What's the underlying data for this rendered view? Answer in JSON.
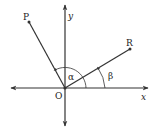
{
  "diagram": {
    "type": "coordinate-angles",
    "labels": {
      "x_axis": "x",
      "y_axis": "y",
      "origin": "O",
      "point_p": "P",
      "point_r": "R",
      "angle_alpha": "α",
      "angle_beta": "β"
    },
    "points": {
      "origin": [
        65,
        88
      ],
      "P": [
        29,
        22
      ],
      "R": [
        130,
        49
      ]
    },
    "colors": {
      "line": "#333333",
      "text": "#222222"
    }
  }
}
